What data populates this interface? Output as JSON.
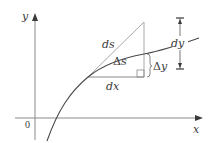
{
  "diagram": {
    "title": "",
    "colors": {
      "axis": "#8a8a8a",
      "curve": "#4a4a4a",
      "tangent": "#a8a8a8",
      "text": "#3a3a3a"
    },
    "axes": {
      "x_label": "x",
      "y_label": "y",
      "origin_label": "0"
    },
    "labels": {
      "ds": "ds",
      "delta_s_symbol": "Δ",
      "delta_s_var": "s",
      "delta_y_symbol": "Δ",
      "delta_y_var": "y",
      "dx": "dx",
      "dy": "dy"
    },
    "elements": [
      {
        "name": "curve",
        "kind": "increasing concave-down curve y=f(x)"
      },
      {
        "name": "tangent-line",
        "kind": "tangent segment of length ds"
      },
      {
        "name": "dx-leg",
        "kind": "horizontal increment dx"
      },
      {
        "name": "delta-y-leg",
        "kind": "vertical side of triangle"
      },
      {
        "name": "delta-y-brace",
        "kind": "brace marking Δy"
      },
      {
        "name": "dy-dimension",
        "kind": "dimension arrow marking dy"
      },
      {
        "name": "right-angle-marker",
        "kind": "square corner marker"
      }
    ]
  }
}
